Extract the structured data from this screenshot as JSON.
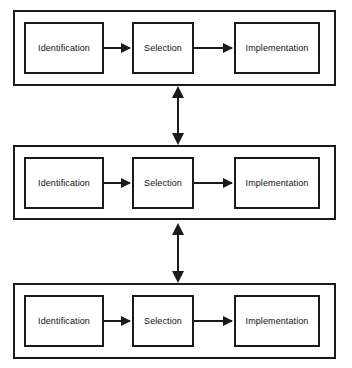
{
  "diagram": {
    "type": "process-flow",
    "title": "",
    "orientation": "horizontal-stages-stacked-tiers",
    "stage_labels": [
      "Identification",
      "Selection",
      "Implementation"
    ],
    "tiers": [
      {
        "id": "tier-1",
        "stages": [
          {
            "label": "Identification"
          },
          {
            "label": "Selection"
          },
          {
            "label": "Implementation"
          }
        ]
      },
      {
        "id": "tier-2",
        "stages": [
          {
            "label": "Identification"
          },
          {
            "label": "Selection"
          },
          {
            "label": "Implementation"
          }
        ]
      },
      {
        "id": "tier-3",
        "stages": [
          {
            "label": "Identification"
          },
          {
            "label": "Selection"
          },
          {
            "label": "Implementation"
          }
        ]
      }
    ],
    "connectors": {
      "horizontal": {
        "style": "single-headed-arrow",
        "direction": "left-to-right",
        "count_per_tier": 2
      },
      "vertical": {
        "style": "double-headed-arrow",
        "direction": "bidirectional",
        "count": 2
      }
    },
    "colors": {
      "stroke": "#1a1a1a",
      "fill": "#ffffff",
      "text": "#111111",
      "background": "#ffffff"
    }
  }
}
